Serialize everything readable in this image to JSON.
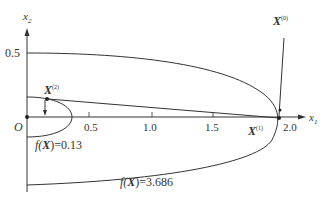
{
  "axes": {
    "x_label": "x",
    "x_sub": "1",
    "y_label": "x",
    "y_sub": "2",
    "origin_label": "O",
    "x_ticks": [
      "0.5",
      "1.0",
      "1.5",
      "2.0"
    ],
    "y_ticks": [
      "0.5"
    ]
  },
  "points": {
    "x0": {
      "label": "X",
      "sup": "(0)"
    },
    "x1": {
      "label": "X",
      "sup": "(1)"
    },
    "x2": {
      "label": "X",
      "sup": "(2)"
    }
  },
  "contours": {
    "inner": {
      "text": "f(X)=0.13",
      "f": "f(",
      "x": "X",
      "rest": ")=0.13"
    },
    "outer": {
      "text": "f(X)=3.686",
      "f": "f(",
      "x": "X",
      "rest": ")=3.686"
    }
  },
  "colors": {
    "stroke": "#333333",
    "background": "#ffffff"
  }
}
